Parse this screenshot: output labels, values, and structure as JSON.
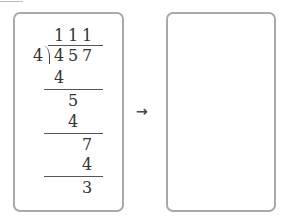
{
  "long_division": {
    "quotient": [
      "1",
      "1",
      "1"
    ],
    "divisor": "4",
    "dividend": [
      "4",
      "5",
      "7"
    ],
    "steps": [
      {
        "value": "4"
      },
      {
        "value": "5"
      },
      {
        "value": "4"
      },
      {
        "value": "7"
      },
      {
        "value": "4"
      },
      {
        "value": "3"
      }
    ]
  },
  "arrow": "→",
  "answer_box": {
    "content": ""
  }
}
